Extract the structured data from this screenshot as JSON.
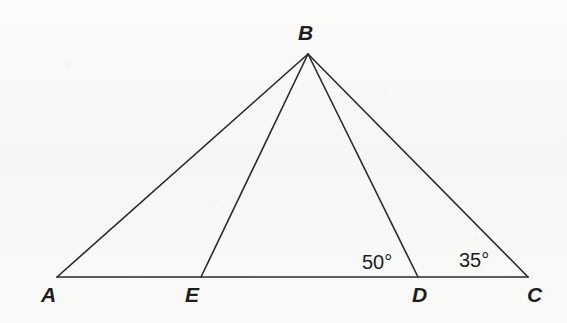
{
  "figure": {
    "type": "euclidean-geometry-diagram",
    "canvas": {
      "width": 567,
      "height": 323
    },
    "style": {
      "background_color": "#f8f8f6",
      "stroke_color": "#2a2a2a",
      "stroke_width": 1.6,
      "label_color": "#1e1e1e"
    },
    "points": [
      {
        "id": "A",
        "label": "A",
        "x": 57,
        "y": 277,
        "label_x": 41,
        "label_y": 284
      },
      {
        "id": "E",
        "label": "E",
        "x": 201,
        "y": 277,
        "label_x": 185,
        "label_y": 284
      },
      {
        "id": "D",
        "label": "D",
        "x": 418,
        "y": 277,
        "label_x": 412,
        "label_y": 284
      },
      {
        "id": "C",
        "label": "C",
        "x": 528,
        "y": 277,
        "label_x": 527,
        "label_y": 284
      },
      {
        "id": "B",
        "label": "B",
        "x": 308,
        "y": 54,
        "label_x": 298,
        "label_y": 22
      }
    ],
    "segments": [
      {
        "id": "AC",
        "from": "A",
        "to": "C",
        "description": "base line through A, E, D, C"
      },
      {
        "id": "AB",
        "from": "A",
        "to": "B",
        "description": "left side of triangle"
      },
      {
        "id": "BC",
        "from": "B",
        "to": "C",
        "description": "right side of triangle"
      },
      {
        "id": "BE",
        "from": "B",
        "to": "E",
        "description": "cevian from B to E"
      },
      {
        "id": "BD",
        "from": "B",
        "to": "D",
        "description": "cevian from B to D"
      }
    ],
    "angle_labels": [
      {
        "id": "angle-BDC",
        "text": "50°",
        "value": 50,
        "unit": "degrees",
        "at_vertex": "D",
        "x": 362,
        "y": 252
      },
      {
        "id": "angle-BCD",
        "text": "35°",
        "value": 35,
        "unit": "degrees",
        "at_vertex": "C",
        "x": 459,
        "y": 250
      }
    ]
  }
}
